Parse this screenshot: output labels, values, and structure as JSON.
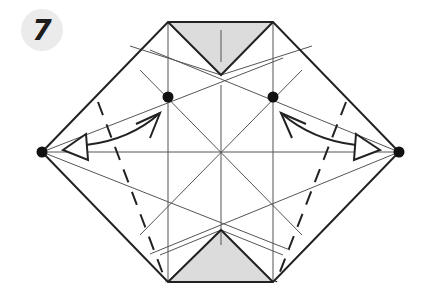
{
  "step": {
    "number": "7"
  },
  "colors": {
    "outline": "#222222",
    "crease": "#555555",
    "shade": "#dcdcdc",
    "dot": "#111111",
    "badge_bg": "#ebebeb"
  },
  "diagram": {
    "shape": "hexagon",
    "vertices": {
      "left": [
        42,
        152
      ],
      "top_left": [
        168,
        22
      ],
      "top_right": [
        273,
        22
      ],
      "right": [
        399,
        152
      ],
      "bottom_right": [
        273,
        282
      ],
      "bottom_left": [
        168,
        282
      ]
    },
    "center": [
      221,
      152
    ],
    "shaded_triangles": [
      {
        "name": "top-flap",
        "points": [
          [
            168,
            22
          ],
          [
            273,
            22
          ],
          [
            221,
            75
          ]
        ]
      },
      {
        "name": "bottom-flap",
        "points": [
          [
            168,
            282
          ],
          [
            273,
            282
          ],
          [
            221,
            230
          ]
        ]
      }
    ],
    "reference_dots": [
      [
        42,
        152
      ],
      [
        399,
        152
      ],
      [
        168,
        97
      ],
      [
        273,
        97
      ]
    ],
    "arrows": [
      {
        "name": "left-push-arrow",
        "from": [
          58,
          152
        ],
        "to": [
          160,
          113
        ]
      },
      {
        "name": "right-push-arrow",
        "from": [
          383,
          152
        ],
        "to": [
          281,
          113
        ]
      }
    ],
    "valley_folds": [
      {
        "name": "left-valley-fold",
        "from": [
          98,
          102
        ],
        "to": [
          164,
          280
        ]
      },
      {
        "name": "right-valley-fold",
        "from": [
          346,
          102
        ],
        "to": [
          278,
          280
        ]
      }
    ]
  }
}
